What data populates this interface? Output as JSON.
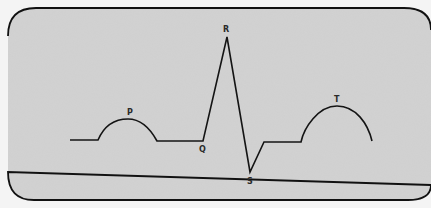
{
  "diagram": {
    "type": "ECG waveform",
    "panel": {
      "background": "#d2d2d2",
      "border_color": "#111111",
      "page_background": "#f4f4f4"
    },
    "trace_color": "#141414",
    "labels": {
      "p": "P",
      "q": "Q",
      "r": "R",
      "s": "S",
      "t": "T"
    },
    "points": {
      "baseline_start": [
        70,
        140
      ],
      "p_start": [
        98,
        140
      ],
      "p_peak": [
        130,
        119
      ],
      "p_end": [
        157,
        141
      ],
      "q": [
        203,
        141
      ],
      "r": [
        227,
        37
      ],
      "s": [
        250,
        172
      ],
      "st_start": [
        264,
        142
      ],
      "t_start": [
        301,
        142
      ],
      "t_peak": [
        337,
        106
      ],
      "t_end": [
        372,
        141
      ]
    }
  }
}
